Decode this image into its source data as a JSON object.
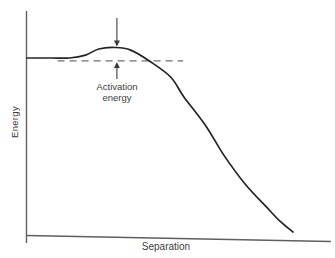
{
  "figure": {
    "background_color": "#ffffff",
    "axis_color": "#5f5f5f",
    "curve_color": "#242424",
    "dash_color": "#6f6f6f",
    "annotation_color": "#3d3d3d"
  },
  "chart_data": {
    "type": "line",
    "title": "",
    "xlabel": "Separation",
    "ylabel": "Energy",
    "x_ticks": [],
    "y_ticks": [],
    "xlim": [
      0,
      1
    ],
    "ylim": [
      0,
      1
    ],
    "grid": false,
    "legend": "none",
    "units": "arbitrary (axes unlabeled numerically)",
    "series": [
      {
        "name": "energy-vs-separation-curve",
        "x": [
          0.0,
          0.09,
          0.16,
          0.22,
          0.27,
          0.33,
          0.39,
          0.46,
          0.54,
          0.59,
          0.67,
          0.74,
          0.82,
          0.9,
          0.95,
          1.0
        ],
        "y": [
          0.943,
          0.943,
          0.943,
          0.959,
          0.992,
          1.0,
          0.986,
          0.927,
          0.84,
          0.732,
          0.58,
          0.417,
          0.26,
          0.136,
          0.06,
          0.0
        ]
      }
    ],
    "annotations": [
      {
        "text": "Activation energy",
        "text_lines": [
          "Activation",
          "energy"
        ],
        "arrow_x": 0.338,
        "peak_level": 1.0,
        "reference_level": 0.927,
        "reference_line_style": "dashed",
        "reference_line_x_range": [
          0.115,
          0.587
        ]
      }
    ]
  }
}
